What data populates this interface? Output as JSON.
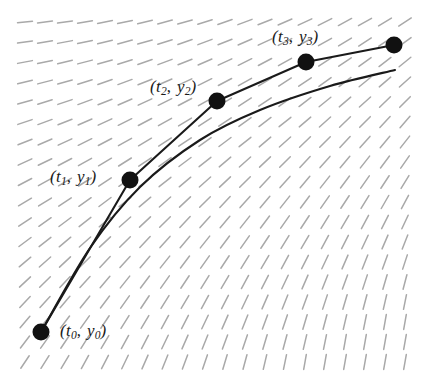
{
  "figure": {
    "type": "slope-field-euler-method-diagram",
    "width": 434,
    "height": 378,
    "background_color": "#ffffff",
    "curve_color": "#1a1a1a",
    "slope_mark_color": "#a9a9a9",
    "point_color": "#111111"
  },
  "labels": {
    "p0": {
      "full": "(t0, y0)",
      "var1": "t",
      "sub1": "0",
      "var2": "y",
      "sub2": "0",
      "x": 60,
      "y": 322
    },
    "p1": {
      "full": "(t1, y1)",
      "var1": "t",
      "sub1": "1",
      "var2": "y",
      "sub2": "1",
      "x": 50,
      "y": 168
    },
    "p2": {
      "full": "(t2, y2)",
      "var1": "t",
      "sub1": "2",
      "var2": "y",
      "sub2": "2",
      "x": 150,
      "y": 78
    },
    "p3": {
      "full": "(t3, y3)",
      "var1": "t",
      "sub1": "3",
      "var2": "y",
      "sub2": "3",
      "x": 272,
      "y": 28
    }
  },
  "chart_data": {
    "type": "line",
    "title": "",
    "xlabel": "",
    "ylabel": "",
    "grid": false,
    "legend": "none",
    "series": [
      {
        "name": "Euler polygonal approximation",
        "style": "polyline-with-markers",
        "points_px": [
          {
            "label": "(t0, y0)",
            "x": 41,
            "y": 332
          },
          {
            "label": "(t1, y1)",
            "x": 130,
            "y": 180
          },
          {
            "label": "(t2, y2)",
            "x": 217,
            "y": 101
          },
          {
            "label": "(t3, y3)",
            "x": 306,
            "y": 62
          },
          {
            "label": "",
            "x": 394,
            "y": 45
          }
        ]
      },
      {
        "name": "Exact solution curve",
        "style": "smooth-curve",
        "points_px": [
          {
            "x": 41,
            "y": 332
          },
          {
            "x": 90,
            "y": 248
          },
          {
            "x": 140,
            "y": 187
          },
          {
            "x": 200,
            "y": 140
          },
          {
            "x": 260,
            "y": 110
          },
          {
            "x": 330,
            "y": 86
          },
          {
            "x": 395,
            "y": 70
          }
        ]
      }
    ],
    "slope_field": {
      "description": "dashed tick marks whose slope increases from nearly horizontal at upper-left to nearly vertical at lower-right",
      "x_start": 25,
      "x_end": 420,
      "y_start": 22,
      "y_end": 370,
      "col_spacing": 20,
      "row_spacing": 20,
      "tick_length": 15,
      "color": "#a9a9a9"
    }
  }
}
